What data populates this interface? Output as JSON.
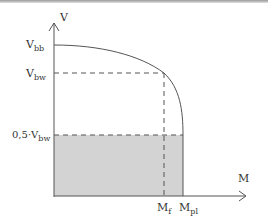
{
  "diagram": {
    "y_axis_label": "V",
    "x_axis_label": "M",
    "y_labels": [
      {
        "main": "V",
        "sub": "bb"
      },
      {
        "main": "V",
        "sub": "bw"
      },
      {
        "main": "0,5·V",
        "sub": "bw"
      }
    ],
    "x_labels": [
      {
        "main": "M",
        "sub": "f"
      },
      {
        "main": "M",
        "sub": "pl"
      }
    ],
    "colors": {
      "line": "#555555",
      "shade": "#d3d3d3",
      "dash": "#555555"
    }
  }
}
